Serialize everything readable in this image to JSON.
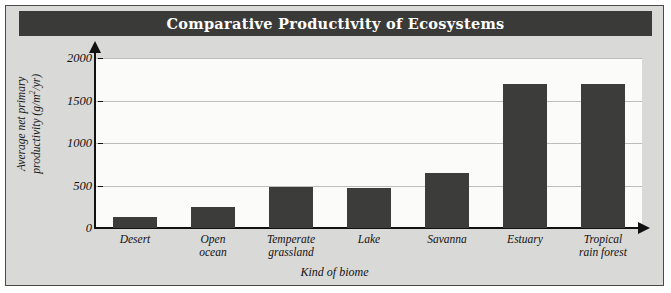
{
  "figure": {
    "title": "Comparative Productivity of Ecosystems",
    "frame_color": "#4a4a48",
    "background_color": "#d9d9d7",
    "title_bar_color": "#3a3a38",
    "plot_background_color": "#fbfbfa",
    "bar_color": "#3c3c3a",
    "gridline_color": "#bdbdbb",
    "axis_color": "#111111"
  },
  "chart_data": {
    "type": "bar",
    "title": "Comparative Productivity of Ecosystems",
    "xlabel": "Kind of biome",
    "ylabel": "Average net primary productivity (g/m2/yr)",
    "ylabel_line1": "Average net primary",
    "ylabel_line2_prefix": "productivity (g/m",
    "ylabel_line2_sup": "2",
    "ylabel_line2_suffix": "/yr)",
    "categories": [
      "Desert",
      "Open ocean",
      "Temperate grassland",
      "Lake",
      "Savanna",
      "Estuary",
      "Tropical rain forest"
    ],
    "category_lines": [
      [
        "Desert"
      ],
      [
        "Open",
        "ocean"
      ],
      [
        "Temperate",
        "grassland"
      ],
      [
        "Lake"
      ],
      [
        "Savanna"
      ],
      [
        "Estuary"
      ],
      [
        "Tropical",
        "rain forest"
      ]
    ],
    "values": [
      125,
      250,
      480,
      470,
      650,
      1700,
      1700
    ],
    "ylim": [
      0,
      2000
    ],
    "yticks": [
      2000,
      1500,
      1000,
      500,
      0
    ],
    "ytick_labels": [
      "2000",
      "1500",
      "1000",
      "500",
      "0"
    ],
    "grid": true,
    "legend": "none",
    "units": "g/m2/yr"
  }
}
